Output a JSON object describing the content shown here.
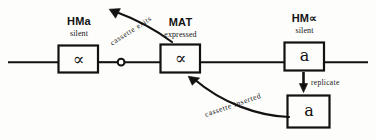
{
  "diagram": {
    "stroke_color": "#121212",
    "background_color": "#fdfdfb",
    "chromosome_line": {
      "label": "chromosome-line",
      "y": 62,
      "x_start": 8,
      "x_end": 368
    },
    "centromere": {
      "label": "centromere",
      "x": 121,
      "y": 62,
      "radius": 3.6
    },
    "loci": [
      {
        "id": "hm-left",
        "title": "HMa",
        "title_plain": "HM",
        "title_symbol": "a",
        "state": "silent",
        "content": "∝",
        "content_name": "alpha-allele"
      },
      {
        "id": "mat",
        "title": "MAT",
        "title_plain": "MAT",
        "title_symbol": "",
        "state": "expressed",
        "content": "∝",
        "content_name": "alpha-allele"
      },
      {
        "id": "hm-right",
        "title": "HM∝",
        "title_plain": "HM",
        "title_symbol": "∝",
        "state": "silent",
        "content": "a",
        "content_name": "a-allele"
      },
      {
        "id": "replicated-copy",
        "title": "",
        "title_plain": "",
        "title_symbol": "",
        "state": "",
        "content": "a",
        "content_name": "a-allele-copy"
      }
    ],
    "arrows": [
      {
        "id": "cassette-exits",
        "label": "cassette  exits",
        "direction": "up-left",
        "rotation_deg": -33
      },
      {
        "id": "cassette-inserted",
        "label": "cassette  inserted",
        "direction": "up-left",
        "rotation_deg": -19
      },
      {
        "id": "replicate",
        "label": "replicate",
        "direction": "down",
        "rotation_deg": 0
      }
    ]
  }
}
